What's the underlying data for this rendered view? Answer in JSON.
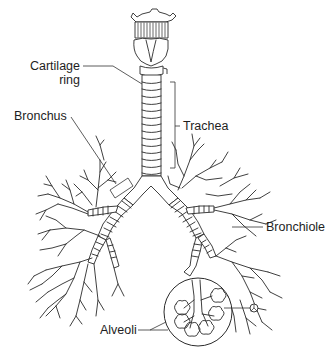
{
  "diagram": {
    "type": "anatomical-illustration",
    "labels": {
      "cartilage_ring_line1": "Cartilage",
      "cartilage_ring_line2": "ring",
      "bronchus": "Bronchus",
      "trachea": "Trachea",
      "bronchiole": "Bronchiole",
      "alveoli": "Alveoli"
    },
    "structures": [
      {
        "name": "larynx",
        "labeled": false
      },
      {
        "name": "trachea",
        "label_key": "trachea"
      },
      {
        "name": "cartilage-ring",
        "label_key": "cartilage_ring"
      },
      {
        "name": "bronchus",
        "label_key": "bronchus"
      },
      {
        "name": "bronchiole",
        "label_key": "bronchiole"
      },
      {
        "name": "alveoli",
        "label_key": "alveoli",
        "shown_in": "magnified-circle-inset"
      }
    ],
    "colors": {
      "line": "#2a2a2a",
      "background": "#ffffff",
      "text": "#1e1e1e"
    }
  }
}
